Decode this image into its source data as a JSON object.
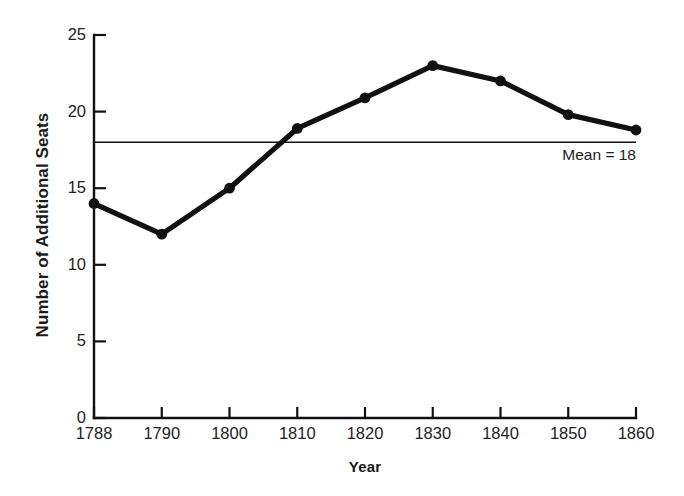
{
  "chart_data": {
    "type": "line",
    "title": "",
    "xlabel": "Year",
    "ylabel": "Number of Additional Seats",
    "categories": [
      "1788",
      "1790",
      "1800",
      "1810",
      "1820",
      "1830",
      "1840",
      "1850",
      "1860"
    ],
    "x": [
      1788,
      1790,
      1800,
      1810,
      1820,
      1830,
      1840,
      1850,
      1860
    ],
    "values": [
      14,
      12,
      15,
      18.9,
      20.9,
      23,
      22,
      19.8,
      18.8
    ],
    "series": [
      {
        "name": "Number of Additional Seats",
        "values": [
          14,
          12,
          15,
          18.9,
          20.9,
          23,
          22,
          19.8,
          18.8
        ]
      }
    ],
    "ylim": [
      0,
      25
    ],
    "yticks": [
      0,
      5,
      10,
      15,
      20,
      25
    ],
    "ytick_labels": [
      "0",
      "5",
      "10",
      "15",
      "20",
      "25"
    ],
    "xtick_labels": [
      "1788",
      "1790",
      "1800",
      "1810",
      "1820",
      "1830",
      "1840",
      "1850",
      "1860"
    ],
    "grid": false,
    "legend": "none",
    "annotations": [
      {
        "type": "hline",
        "label": "Mean = 18",
        "value": 18
      }
    ],
    "line_color": "#111111",
    "marker": "circle",
    "marker_color": "#111111"
  },
  "axes": {
    "y_title": "Number of Additional Seats",
    "x_title": "Year"
  },
  "mean_line": {
    "label": "Mean = 18"
  }
}
